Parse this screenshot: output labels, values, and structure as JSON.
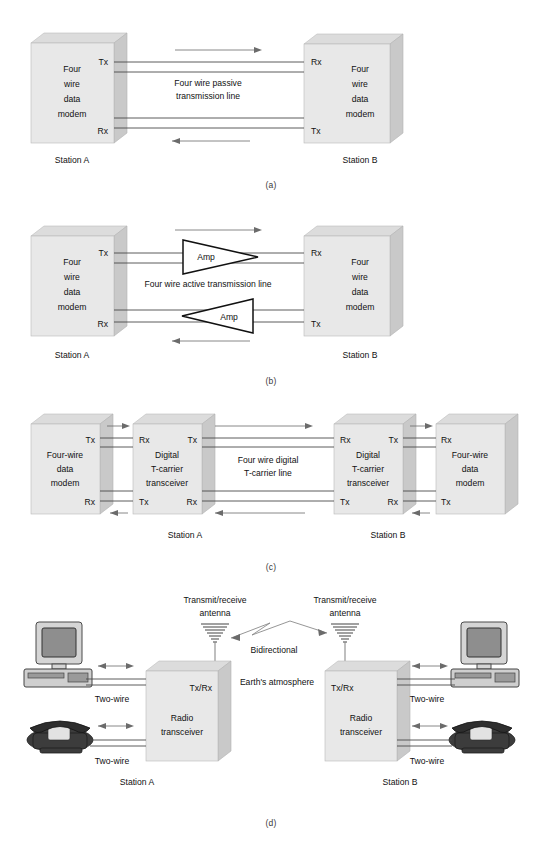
{
  "figure": {
    "panels": [
      {
        "id": "a",
        "caption": "(a)",
        "center_label_line1": "Four wire passive",
        "center_label_line2": "transmission line",
        "left_box": {
          "l1": "Four",
          "l2": "wire",
          "l3": "data",
          "l4": "modem",
          "port_top": "Tx",
          "port_bottom": "Rx"
        },
        "right_box": {
          "l1": "Four",
          "l2": "wire",
          "l3": "data",
          "l4": "modem",
          "port_top": "Rx",
          "port_bottom": "Tx"
        },
        "station_left": "Station A",
        "station_right": "Station B"
      },
      {
        "id": "b",
        "caption": "(b)",
        "center_label": "Four wire active transmission line",
        "amp_top": "Amp",
        "amp_bottom": "Amp",
        "left_box": {
          "l1": "Four",
          "l2": "wire",
          "l3": "data",
          "l4": "modem",
          "port_top": "Tx",
          "port_bottom": "Rx"
        },
        "right_box": {
          "l1": "Four",
          "l2": "wire",
          "l3": "data",
          "l4": "modem",
          "port_top": "Rx",
          "port_bottom": "Tx"
        },
        "station_left": "Station A",
        "station_right": "Station B"
      },
      {
        "id": "c",
        "caption": "(c)",
        "center_label_line1": "Four wire digital",
        "center_label_line2": "T-carrier line",
        "box1": {
          "l1": "Four-wire",
          "l2": "data",
          "l3": "modem",
          "port_top": "Tx",
          "port_bottom": "Rx"
        },
        "box2": {
          "l1": "Digital",
          "l2": "T-carrier",
          "l3": "transceiver",
          "port_top_left": "Rx",
          "port_top_right": "Tx",
          "port_bottom_left": "Tx",
          "port_bottom_right": "Rx"
        },
        "box3": {
          "l1": "Digital",
          "l2": "T-carrier",
          "l3": "transceiver",
          "port_top_left": "Rx",
          "port_top_right": "Tx",
          "port_bottom_left": "Tx",
          "port_bottom_right": "Rx"
        },
        "box4": {
          "l1": "Four-wire",
          "l2": "data",
          "l3": "modem",
          "port_top": "Rx",
          "port_bottom": "Tx"
        },
        "station_left": "Station A",
        "station_right": "Station B"
      },
      {
        "id": "d",
        "caption": "(d)",
        "antenna_left_line1": "Transmit/receive",
        "antenna_left_line2": "antenna",
        "antenna_right_line1": "Transmit/receive",
        "antenna_right_line2": "antenna",
        "bidirectional": "Bidirectional",
        "atmosphere": "Earth's atmosphere",
        "left_box": {
          "port": "Tx/Rx",
          "l1": "Radio",
          "l2": "transceiver"
        },
        "right_box": {
          "port": "Tx/Rx",
          "l1": "Radio",
          "l2": "transceiver"
        },
        "twowire_computer_left": "Two-wire",
        "twowire_phone_left": "Two-wire",
        "twowire_computer_right": "Two-wire",
        "twowire_phone_right": "Two-wire",
        "station_left": "Station A",
        "station_right": "Station B"
      }
    ]
  },
  "icons": {
    "computer": "computer-icon",
    "telephone": "telephone-icon",
    "antenna": "antenna-icon",
    "amplifier": "amplifier-triangle-icon",
    "lightning": "lightning-bolt-icon"
  },
  "colors": {
    "box_front": "#e8e8e8",
    "box_top": "#dcdcdc",
    "box_side": "#c9c9c9",
    "wire": "#4a4a4a",
    "arrow": "#6b6b6b",
    "text": "#111111"
  }
}
